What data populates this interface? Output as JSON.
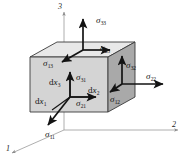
{
  "figure": {
    "background_color": "#ffffff",
    "stroke_color": "#131313",
    "axis_color": "#8d8d8d",
    "cube": {
      "front_face_color": "#d2d2d2",
      "top_face_color": "#e6e6e6",
      "right_face_color": "#a8a8a8",
      "edge_color": "#3a3a3a"
    }
  },
  "axes": [
    {
      "id": "axis-3",
      "label": "3",
      "orientation": "vertical-up"
    },
    {
      "id": "axis-2",
      "label": "2",
      "orientation": "horizontal-right"
    },
    {
      "id": "axis-1",
      "label": "1",
      "orientation": "diagonal-down-left"
    }
  ],
  "stress_labels": [
    {
      "id": "sigma-33-top",
      "symbol": "σ",
      "sub": "33",
      "face": "top",
      "direction": "up",
      "x": 96,
      "y": 16
    },
    {
      "id": "sigma-23-top",
      "symbol": "σ",
      "sub": "23",
      "face": "top",
      "direction": "right",
      "x": 100,
      "y": 44
    },
    {
      "id": "sigma-13-top",
      "symbol": "σ",
      "sub": "13",
      "face": "top",
      "direction": "down-left",
      "x": 43,
      "y": 59
    },
    {
      "id": "sigma-32-right",
      "symbol": "σ",
      "sub": "32",
      "face": "right",
      "direction": "up",
      "x": 126,
      "y": 61
    },
    {
      "id": "sigma-22-right",
      "symbol": "σ",
      "sub": "22",
      "face": "right",
      "direction": "right",
      "x": 146,
      "y": 75
    },
    {
      "id": "sigma-12-right",
      "symbol": "σ",
      "sub": "12",
      "face": "right",
      "direction": "down-left",
      "x": 110,
      "y": 95
    },
    {
      "id": "sigma-31-front",
      "symbol": "σ",
      "sub": "31",
      "face": "front",
      "direction": "up",
      "x": 78,
      "y": 73
    },
    {
      "id": "sigma-21-front",
      "symbol": "σ",
      "sub": "21",
      "face": "front",
      "direction": "right",
      "x": 77,
      "y": 99
    },
    {
      "id": "sigma-11-front",
      "symbol": "σ",
      "sub": "11",
      "face": "front",
      "direction": "down-left",
      "x": 45,
      "y": 131
    }
  ],
  "edge_labels": [
    {
      "id": "dx-3",
      "prefix": "d",
      "symbol": "x",
      "sub": "3",
      "x": 50,
      "y": 79
    },
    {
      "id": "dx-2",
      "prefix": "d",
      "symbol": "x",
      "sub": "2",
      "x": 88,
      "y": 87
    },
    {
      "id": "dx-1",
      "prefix": "d",
      "symbol": "x",
      "sub": "1",
      "x": 37,
      "y": 98
    }
  ]
}
